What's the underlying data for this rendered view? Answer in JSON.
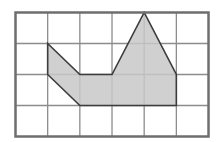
{
  "diagram": {
    "type": "grid-shape",
    "grid": {
      "cols": 6,
      "rows": 4,
      "left": 15.5,
      "top": 12.5,
      "cell_w": 32.17,
      "cell_h": 31
    },
    "shape_vertices_grid": [
      [
        1,
        1
      ],
      [
        2,
        2
      ],
      [
        3,
        2
      ],
      [
        4,
        0
      ],
      [
        5,
        2
      ],
      [
        5,
        3
      ],
      [
        2,
        3
      ],
      [
        1,
        2
      ]
    ],
    "colors": {
      "grid_line": "#8c8c8c",
      "border": "#6e6e6e",
      "fill": "#c8c8c8",
      "outline": "#3c3c3c",
      "background": "#ffffff"
    }
  }
}
